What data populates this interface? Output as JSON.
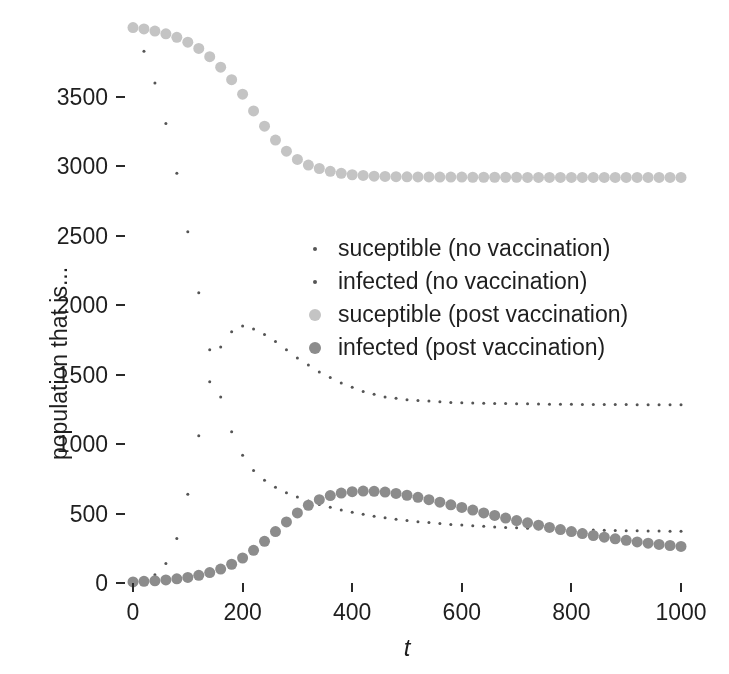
{
  "chart_data": {
    "type": "scatter",
    "title": "",
    "xlabel": "t",
    "ylabel": "population that is...",
    "xlim": [
      0,
      1000
    ],
    "ylim": [
      0,
      3700
    ],
    "xticks": [
      0,
      200,
      400,
      600,
      800,
      1000
    ],
    "yticks": [
      0,
      500,
      1000,
      1500,
      2000,
      2500,
      3000,
      3500
    ],
    "grid": false,
    "legend_position": "center",
    "series": [
      {
        "name": "suceptible (no vaccination)",
        "color": "#555555",
        "marker": "dot",
        "marker_size": 3,
        "x": [
          0,
          20,
          40,
          60,
          80,
          100,
          120,
          140,
          160,
          180,
          200,
          220,
          240,
          260,
          280,
          300,
          320,
          340,
          360,
          380,
          400,
          420,
          440,
          460,
          480,
          500,
          520,
          540,
          560,
          580,
          600,
          620,
          640,
          660,
          680,
          700,
          720,
          740,
          760,
          780,
          800,
          820,
          840,
          860,
          880,
          900,
          920,
          940,
          960,
          980,
          1000
        ],
        "y": [
          4000,
          3830,
          3600,
          3310,
          2950,
          2530,
          2090,
          1680,
          1340,
          1090,
          920,
          810,
          740,
          690,
          650,
          620,
          590,
          565,
          545,
          525,
          510,
          495,
          480,
          470,
          460,
          450,
          442,
          435,
          428,
          422,
          417,
          412,
          408,
          404,
          400,
          397,
          394,
          391,
          389,
          387,
          385,
          383,
          381,
          380,
          378,
          377,
          376,
          375,
          374,
          373,
          372
        ]
      },
      {
        "name": "infected (no vaccination)",
        "color": "#555555",
        "marker": "dot",
        "marker_size": 3,
        "x": [
          0,
          20,
          40,
          60,
          80,
          100,
          120,
          140,
          160,
          180,
          200,
          220,
          240,
          260,
          280,
          300,
          320,
          340,
          360,
          380,
          400,
          420,
          440,
          460,
          480,
          500,
          520,
          540,
          560,
          580,
          600,
          620,
          640,
          660,
          680,
          700,
          720,
          740,
          760,
          780,
          800,
          820,
          840,
          860,
          880,
          900,
          920,
          940,
          960,
          980,
          1000
        ],
        "y": [
          10,
          25,
          60,
          140,
          320,
          640,
          1060,
          1450,
          1700,
          1810,
          1850,
          1830,
          1790,
          1740,
          1680,
          1620,
          1570,
          1520,
          1480,
          1440,
          1410,
          1380,
          1360,
          1340,
          1330,
          1320,
          1315,
          1310,
          1305,
          1300,
          1298,
          1296,
          1294,
          1293,
          1292,
          1291,
          1290,
          1289,
          1288,
          1287,
          1287,
          1286,
          1286,
          1285,
          1285,
          1285,
          1284,
          1284,
          1284,
          1283,
          1283
        ]
      },
      {
        "name": "suceptible (post vaccination)",
        "color": "#c4c4c4",
        "marker": "circle",
        "marker_size": 11,
        "x": [
          0,
          20,
          40,
          60,
          80,
          100,
          120,
          140,
          160,
          180,
          200,
          220,
          240,
          260,
          280,
          300,
          320,
          340,
          360,
          380,
          400,
          420,
          440,
          460,
          480,
          500,
          520,
          540,
          560,
          580,
          600,
          620,
          640,
          660,
          680,
          700,
          720,
          740,
          760,
          780,
          800,
          820,
          840,
          860,
          880,
          900,
          920,
          940,
          960,
          980,
          1000
        ],
        "y": [
          4000,
          3990,
          3975,
          3955,
          3930,
          3895,
          3850,
          3790,
          3715,
          3625,
          3520,
          3400,
          3290,
          3190,
          3110,
          3050,
          3010,
          2985,
          2965,
          2950,
          2940,
          2935,
          2930,
          2928,
          2926,
          2925,
          2924,
          2924,
          2923,
          2923,
          2923,
          2922,
          2922,
          2922,
          2922,
          2922,
          2921,
          2921,
          2921,
          2921,
          2921,
          2921,
          2921,
          2921,
          2921,
          2921,
          2921,
          2921,
          2921,
          2921,
          2921
        ]
      },
      {
        "name": "infected (post vaccination)",
        "color": "#8c8c8c",
        "marker": "circle",
        "marker_size": 11,
        "x": [
          0,
          20,
          40,
          60,
          80,
          100,
          120,
          140,
          160,
          180,
          200,
          220,
          240,
          260,
          280,
          300,
          320,
          340,
          360,
          380,
          400,
          420,
          440,
          460,
          480,
          500,
          520,
          540,
          560,
          580,
          600,
          620,
          640,
          660,
          680,
          700,
          720,
          740,
          760,
          780,
          800,
          820,
          840,
          860,
          880,
          900,
          920,
          940,
          960,
          980,
          1000
        ],
        "y": [
          8,
          12,
          16,
          22,
          30,
          40,
          55,
          75,
          100,
          135,
          180,
          235,
          300,
          370,
          440,
          505,
          560,
          600,
          630,
          648,
          658,
          662,
          660,
          655,
          645,
          632,
          617,
          600,
          582,
          563,
          544,
          525,
          505,
          487,
          468,
          450,
          433,
          416,
          400,
          385,
          370,
          356,
          342,
          330,
          318,
          307,
          296,
          287,
          278,
          270,
          263
        ]
      }
    ]
  },
  "axes": {
    "ytick_labels": [
      "0",
      "500",
      "1000",
      "1500",
      "2000",
      "2500",
      "3000",
      "3500"
    ],
    "xtick_labels": [
      "0",
      "200",
      "400",
      "600",
      "800",
      "1000"
    ],
    "ylabel_text": "population that is...",
    "xlabel_text": "t"
  },
  "legend": {
    "entries": [
      {
        "label": "suceptible (no vaccination)",
        "color": "#555555",
        "size": 4
      },
      {
        "label": "infected (no vaccination)",
        "color": "#555555",
        "size": 4
      },
      {
        "label": "suceptible (post vaccination)",
        "color": "#c4c4c4",
        "size": 12
      },
      {
        "label": "infected (post vaccination)",
        "color": "#8c8c8c",
        "size": 12
      }
    ]
  }
}
